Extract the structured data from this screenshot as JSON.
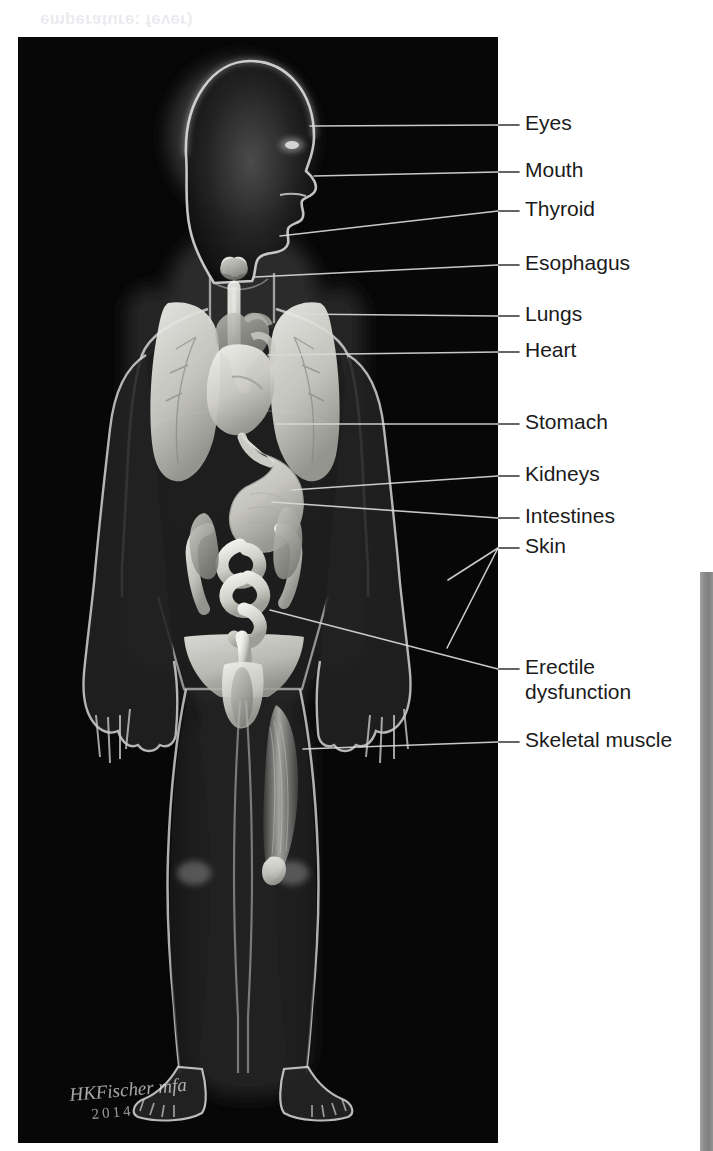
{
  "page": {
    "ghost_text": "emperature: fever)",
    "background_color": "#ffffff",
    "plate_color": "#070707",
    "label_text_color": "#1b1b1b",
    "leader_line_color": "#d9d9d9",
    "margin_bar_color": "#8c8c8c"
  },
  "figure": {
    "signature": "HKFischer mfa",
    "signature_year": "2014"
  },
  "callouts": [
    {
      "id": "eyes",
      "label": "Eyes",
      "text_y": 110,
      "leader_y": 125,
      "dash_x0": 497,
      "dash_x1": 519,
      "target_x": 310,
      "target_y": 126,
      "fork": false
    },
    {
      "id": "mouth",
      "label": "Mouth",
      "text_y": 157,
      "leader_y": 172,
      "dash_x0": 497,
      "dash_x1": 519,
      "target_x": 314,
      "target_y": 176,
      "fork": false
    },
    {
      "id": "thyroid",
      "label": "Thyroid",
      "text_y": 196,
      "leader_y": 211,
      "dash_x0": 497,
      "dash_x1": 519,
      "target_x": 280,
      "target_y": 236,
      "fork": false
    },
    {
      "id": "esophagus",
      "label": "Esophagus",
      "text_y": 250,
      "leader_y": 265,
      "dash_x0": 497,
      "dash_x1": 519,
      "target_x": 255,
      "target_y": 277,
      "fork": false
    },
    {
      "id": "lungs",
      "label": "Lungs",
      "text_y": 301,
      "leader_y": 316,
      "dash_x0": 497,
      "dash_x1": 519,
      "target_x": 296,
      "target_y": 314,
      "fork": false
    },
    {
      "id": "heart",
      "label": "Heart",
      "text_y": 337,
      "leader_y": 352,
      "dash_x0": 497,
      "dash_x1": 519,
      "target_x": 268,
      "target_y": 355,
      "fork": false
    },
    {
      "id": "stomach",
      "label": "Stomach",
      "text_y": 409,
      "leader_y": 424,
      "dash_x0": 497,
      "dash_x1": 519,
      "target_x": 276,
      "target_y": 424,
      "fork": false
    },
    {
      "id": "kidneys",
      "label": "Kidneys",
      "text_y": 461,
      "leader_y": 476,
      "dash_x0": 497,
      "dash_x1": 519,
      "target_x": 292,
      "target_y": 490,
      "fork": false
    },
    {
      "id": "intestines",
      "label": "Intestines",
      "text_y": 503,
      "leader_y": 518,
      "dash_x0": 497,
      "dash_x1": 519,
      "target_x": 272,
      "target_y": 502,
      "fork": false
    },
    {
      "id": "skin",
      "label": "Skin",
      "text_y": 533,
      "leader_y": 548,
      "dash_x0": 497,
      "dash_x1": 519,
      "target_x": 448,
      "target_y": 580,
      "fork": true,
      "fork_x": 447,
      "fork_y": 648
    },
    {
      "id": "erectile",
      "label": "Erectile\ndysfunction",
      "text_y": 654,
      "leader_y": 669,
      "dash_x0": 497,
      "dash_x1": 519,
      "target_x": 270,
      "target_y": 610,
      "fork": false
    },
    {
      "id": "skeletal-muscle",
      "label": "Skeletal muscle",
      "text_y": 727,
      "leader_y": 742,
      "dash_x0": 497,
      "dash_x1": 519,
      "target_x": 303,
      "target_y": 749,
      "fork": false
    }
  ]
}
